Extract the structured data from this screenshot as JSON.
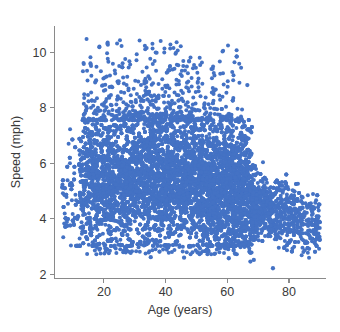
{
  "chart_data": {
    "type": "scatter",
    "title": "",
    "xlabel": "Age (years)",
    "ylabel": "Speed (mph)",
    "xlim": [
      4,
      92
    ],
    "ylim": [
      1.85,
      10.95
    ],
    "xticks": [
      20,
      40,
      60,
      80
    ],
    "yticks": [
      2,
      4,
      6,
      8,
      10
    ],
    "xtick_labels": [
      "20",
      "40",
      "60",
      "80"
    ],
    "ytick_labels": [
      "2",
      "4",
      "6",
      "8",
      "10"
    ],
    "grid": false,
    "legend": null,
    "marker": {
      "shape": "circle",
      "color": "#4472C4",
      "size_px": 2.6,
      "opacity": 1.0
    },
    "series": [
      {
        "name": "observations",
        "color": "#4472C4",
        "n_points_approx": 9000,
        "description": "Dense cloud of walking-speed observations by age; sharp left edge near age 12, solid body between 3.0 and 7.6 mph spanning ages 12-68, upper sparse fringe reaching 10.5 mph around ages 28-38, abrupt right edge near age 68 followed by a thin declining tail out to age 89.",
        "density_regions": [
          {
            "x_range": [
              12,
              68
            ],
            "y_range": [
              3.05,
              7.55
            ],
            "density": "saturated"
          },
          {
            "x_range": [
              12,
              68
            ],
            "y_range": [
              7.55,
              8.3
            ],
            "density": "high"
          },
          {
            "x_range": [
              14,
              62
            ],
            "y_range": [
              8.3,
              9.3
            ],
            "density": "medium"
          },
          {
            "x_range": [
              20,
              52
            ],
            "y_range": [
              9.3,
              10.5
            ],
            "density": "sparse"
          },
          {
            "x_range": [
              68,
              90
            ],
            "y_range": [
              2.6,
              5.3
            ],
            "density": "sparse-tail"
          },
          {
            "x_range": [
              12,
              68
            ],
            "y_range": [
              2.55,
              3.05
            ],
            "density": "sparse-floor"
          }
        ],
        "outliers": [
          {
            "x": 7.2,
            "y": 3.83
          },
          {
            "x": 9.1,
            "y": 3.76
          },
          {
            "x": 66.5,
            "y": 8.82
          },
          {
            "x": 74.8,
            "y": 2.22
          },
          {
            "x": 67.5,
            "y": 2.46
          },
          {
            "x": 68.6,
            "y": 2.52
          },
          {
            "x": 35.2,
            "y": 2.62
          },
          {
            "x": 46.0,
            "y": 2.6
          },
          {
            "x": 60.5,
            "y": 2.58
          },
          {
            "x": 88.8,
            "y": 3.72
          },
          {
            "x": 86.5,
            "y": 2.92
          },
          {
            "x": 81.0,
            "y": 4.55
          }
        ]
      }
    ]
  },
  "axes": {
    "x_axis_name": "Age (years)",
    "y_axis_name": "Speed (mph)"
  }
}
